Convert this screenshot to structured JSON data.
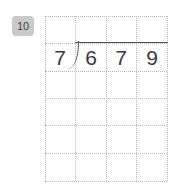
{
  "problem": {
    "number": "10",
    "divisor": "7",
    "dividend_digits": [
      "6",
      "7",
      "9"
    ]
  },
  "grid": {
    "columns": 4,
    "rows": 6
  },
  "colors": {
    "badge": "#c9c9c9",
    "grid_line": "#b8b8b8",
    "ink": "#3a3a3a"
  }
}
